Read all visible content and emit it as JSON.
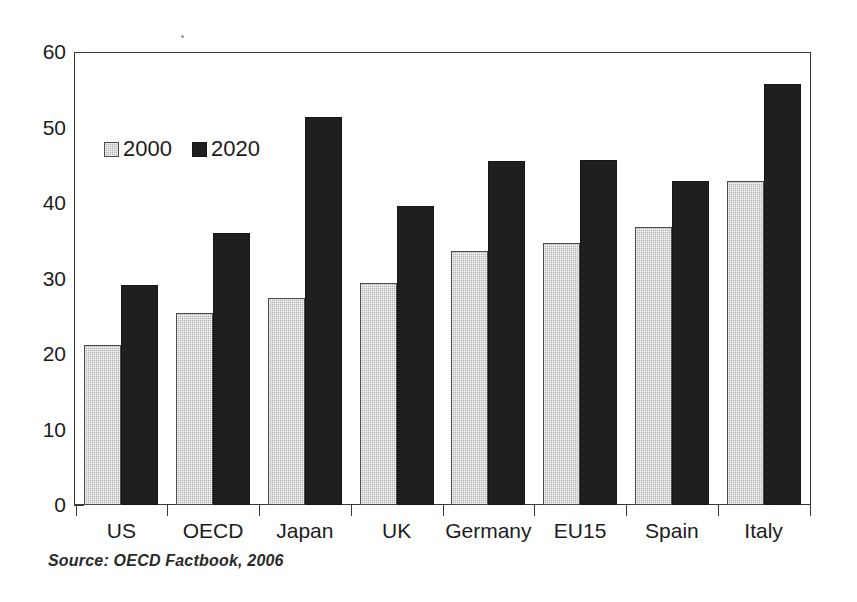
{
  "chart_data": {
    "type": "bar",
    "title": "",
    "subtitle": "",
    "xlabel": "",
    "ylabel": "",
    "categories": [
      "US",
      "OECD",
      "Japan",
      "UK",
      "Germany",
      "EU15",
      "Spain",
      "Italy"
    ],
    "series": [
      {
        "name": "2000",
        "color": "#b4b4b4",
        "values": [
          21.3,
          25.5,
          27.5,
          29.5,
          33.7,
          34.8,
          36.9,
          43.1
        ]
      },
      {
        "name": "2020",
        "color": "#1f1f1f",
        "values": [
          29.3,
          36.2,
          51.5,
          39.7,
          45.7,
          45.8,
          43.0,
          56.0
        ]
      }
    ],
    "ylim": [
      0,
      60
    ],
    "ytick_values": [
      0,
      10,
      20,
      30,
      40,
      50,
      60
    ],
    "ytick_labels": [
      "0",
      "10",
      "20",
      "30",
      "40",
      "50",
      "60"
    ],
    "grid": false,
    "legend_position": "upper-left-inside",
    "legend_entries": [
      "2000",
      "2020"
    ],
    "annotations": [
      "Source:  OECD Factbook, 2006"
    ]
  },
  "figure": {
    "source_note": "Source:  OECD Factbook, 2006"
  }
}
